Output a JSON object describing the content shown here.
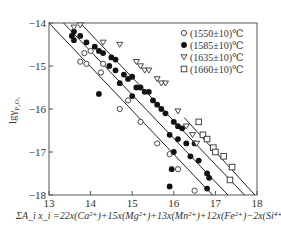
{
  "chart_data": {
    "type": "scatter",
    "title": "",
    "xlabel": "ΣA_i x_i = 22x(Ca²⁺)+15x(Mg²⁺)+13x(Mn²⁺)+12x(Fe²⁺)−2x(Si⁴⁺)",
    "ylabel": "lg γ_P2O5",
    "xlim": [
      13,
      18
    ],
    "ylim": [
      -18,
      -14
    ],
    "x_ticks": [
      "13",
      "14",
      "15",
      "16",
      "17",
      "18"
    ],
    "y_ticks": [
      "-14",
      "-15",
      "-16",
      "-17",
      "-18"
    ],
    "grid": false,
    "legend_position": "upper right",
    "series": [
      {
        "name": "(1550±10)℃",
        "marker": "open-circle",
        "points": [
          [
            13.85,
            -14.7
          ],
          [
            14.0,
            -14.65
          ],
          [
            13.75,
            -14.9
          ],
          [
            13.9,
            -14.95
          ],
          [
            14.3,
            -14.95
          ],
          [
            14.25,
            -15.15
          ],
          [
            14.9,
            -15.8
          ],
          [
            15.2,
            -16.3
          ],
          [
            14.7,
            -16.0
          ],
          [
            15.6,
            -16.8
          ],
          [
            15.9,
            -17.05
          ],
          [
            16.1,
            -17.4
          ],
          [
            16.5,
            -17.9
          ]
        ]
      },
      {
        "name": "(1585±10)℃",
        "marker": "filled-circle",
        "points": [
          [
            13.55,
            -14.3
          ],
          [
            13.6,
            -14.2
          ],
          [
            13.75,
            -14.3
          ],
          [
            13.6,
            -14.4
          ],
          [
            13.9,
            -14.45
          ],
          [
            14.1,
            -14.55
          ],
          [
            14.2,
            -14.65
          ],
          [
            14.3,
            -14.7
          ],
          [
            14.5,
            -14.8
          ],
          [
            14.6,
            -14.85
          ],
          [
            14.45,
            -15.0
          ],
          [
            14.6,
            -15.1
          ],
          [
            14.8,
            -15.2
          ],
          [
            14.9,
            -15.3
          ],
          [
            15.0,
            -15.25
          ],
          [
            14.7,
            -15.4
          ],
          [
            15.1,
            -15.5
          ],
          [
            15.2,
            -15.5
          ],
          [
            15.3,
            -15.6
          ],
          [
            15.4,
            -15.6
          ],
          [
            15.0,
            -15.7
          ],
          [
            15.5,
            -15.8
          ],
          [
            15.6,
            -15.9
          ],
          [
            15.7,
            -16.0
          ],
          [
            14.2,
            -15.65
          ],
          [
            15.8,
            -16.1
          ],
          [
            16.0,
            -16.3
          ],
          [
            16.1,
            -16.4
          ],
          [
            16.2,
            -16.45
          ],
          [
            15.9,
            -16.6
          ],
          [
            16.1,
            -16.7
          ],
          [
            16.3,
            -16.8
          ],
          [
            16.5,
            -16.8
          ],
          [
            16.0,
            -17.0
          ],
          [
            16.4,
            -17.1
          ],
          [
            16.6,
            -17.2
          ],
          [
            15.95,
            -17.4
          ],
          [
            16.8,
            -17.5
          ],
          [
            16.85,
            -17.6
          ],
          [
            15.9,
            -17.8
          ],
          [
            16.8,
            -17.85
          ]
        ]
      },
      {
        "name": "(1635±10)℃",
        "marker": "open-triangle-down",
        "points": [
          [
            13.6,
            -14.1
          ],
          [
            13.75,
            -14.05
          ],
          [
            14.3,
            -14.45
          ],
          [
            14.7,
            -14.5
          ],
          [
            15.1,
            -14.9
          ],
          [
            15.2,
            -15.0
          ],
          [
            15.3,
            -15.1
          ],
          [
            15.4,
            -15.1
          ],
          [
            15.6,
            -15.3
          ],
          [
            15.7,
            -15.4
          ],
          [
            15.8,
            -15.4
          ],
          [
            16.1,
            -16.05
          ],
          [
            16.3,
            -16.4
          ],
          [
            16.45,
            -16.6
          ],
          [
            16.55,
            -16.8
          ]
        ]
      },
      {
        "name": "(1660±10)℃",
        "marker": "open-square",
        "points": [
          [
            16.6,
            -16.3
          ],
          [
            16.7,
            -16.6
          ],
          [
            16.8,
            -16.7
          ],
          [
            16.95,
            -16.9
          ],
          [
            17.0,
            -17.0
          ],
          [
            17.2,
            -17.1
          ],
          [
            17.4,
            -17.35
          ],
          [
            17.35,
            -17.65
          ]
        ]
      }
    ],
    "fit_lines": [
      {
        "x": [
          13.0,
          16.93
        ],
        "y": [
          -14,
          -18
        ]
      },
      {
        "x": [
          13.35,
          17.3
        ],
        "y": [
          -14,
          -18
        ]
      },
      {
        "x": [
          13.75,
          17.7
        ],
        "y": [
          -14,
          -18
        ]
      },
      {
        "x": [
          16.25,
          17.95
        ],
        "y": [
          -16.2,
          -18
        ]
      }
    ]
  },
  "legend": [
    {
      "label": "(1550±10)℃"
    },
    {
      "label": "(1585±10)℃"
    },
    {
      "label": "(1635±10)℃"
    },
    {
      "label": "(1660±10)℃"
    }
  ],
  "axis": {
    "ylabel_main": "lgγ",
    "ylabel_sub": "P₂O₅",
    "xlabel": "ΣA_i x_i =22x(Ca²⁺)+15x(Mg²⁺)+13x(Mn²⁺)+12x(Fe²⁺)−2x(Si⁴⁺)"
  }
}
